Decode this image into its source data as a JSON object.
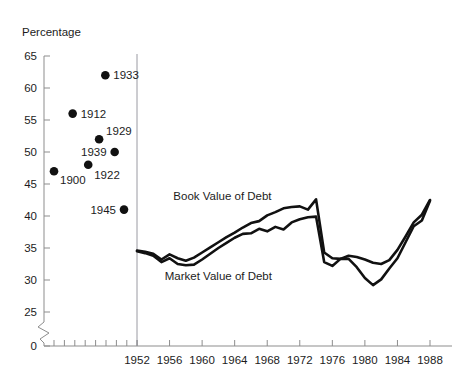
{
  "chart_data": {
    "type": "line",
    "title": "",
    "ylabel": "Percentage",
    "xlabel": "",
    "ylim": [
      25,
      65
    ],
    "y_break_at": 0,
    "y_ticks": [
      0,
      25,
      30,
      35,
      40,
      45,
      50,
      55,
      60,
      65
    ],
    "y_tick_labels": [
      "0",
      "25",
      "30",
      "35",
      "40",
      "45",
      "50",
      "55",
      "60",
      "65"
    ],
    "xlim": [
      1950,
      1989
    ],
    "x_ticks": [
      1952,
      1956,
      1960,
      1964,
      1968,
      1972,
      1976,
      1980,
      1984,
      1988
    ],
    "x_tick_labels": [
      "1952",
      "1956",
      "1960",
      "1964",
      "1968",
      "1972",
      "1976",
      "1980",
      "1984",
      "1988"
    ],
    "grid": false,
    "legend_position": "inline-annotations",
    "scatter_points": [
      {
        "label": "1900",
        "x": 1900,
        "y": 47.0,
        "label_dx": 6,
        "label_dy": 13,
        "label_anchor": "start"
      },
      {
        "label": "1912",
        "x": 1912,
        "y": 56.0,
        "label_dx": 8,
        "label_dy": 4,
        "label_anchor": "start"
      },
      {
        "label": "1922",
        "x": 1922,
        "y": 48.0,
        "label_dx": 6,
        "label_dy": 14,
        "label_anchor": "start"
      },
      {
        "label": "1929",
        "x": 1929,
        "y": 52.0,
        "label_dx": 7,
        "label_dy": -4,
        "label_anchor": "start"
      },
      {
        "label": "1933",
        "x": 1933,
        "y": 62.0,
        "label_dx": 8,
        "label_dy": 4,
        "label_anchor": "start"
      },
      {
        "label": "1939",
        "x": 1939,
        "y": 50.0,
        "label_dx": -8,
        "label_dy": 4,
        "label_anchor": "end"
      },
      {
        "label": "1945",
        "x": 1945,
        "y": 41.0,
        "label_dx": -8,
        "label_dy": 4,
        "label_anchor": "end"
      }
    ],
    "series": [
      {
        "name": "Book Value of Debt",
        "color": "#111111",
        "label_x": 1962.5,
        "label_y": 42.5,
        "values": [
          {
            "x": 1952,
            "y": 34.6
          },
          {
            "x": 1953,
            "y": 34.4
          },
          {
            "x": 1954,
            "y": 34.1
          },
          {
            "x": 1955,
            "y": 33.2
          },
          {
            "x": 1956,
            "y": 34.0
          },
          {
            "x": 1957,
            "y": 33.4
          },
          {
            "x": 1958,
            "y": 33.0
          },
          {
            "x": 1959,
            "y": 33.5
          },
          {
            "x": 1960,
            "y": 34.3
          },
          {
            "x": 1961,
            "y": 35.1
          },
          {
            "x": 1962,
            "y": 35.9
          },
          {
            "x": 1963,
            "y": 36.7
          },
          {
            "x": 1964,
            "y": 37.4
          },
          {
            "x": 1965,
            "y": 38.2
          },
          {
            "x": 1966,
            "y": 38.9
          },
          {
            "x": 1967,
            "y": 39.2
          },
          {
            "x": 1968,
            "y": 40.1
          },
          {
            "x": 1969,
            "y": 40.6
          },
          {
            "x": 1970,
            "y": 41.2
          },
          {
            "x": 1971,
            "y": 41.4
          },
          {
            "x": 1972,
            "y": 41.5
          },
          {
            "x": 1973,
            "y": 41.0
          },
          {
            "x": 1974,
            "y": 42.6
          },
          {
            "x": 1975,
            "y": 34.3
          },
          {
            "x": 1976,
            "y": 33.4
          },
          {
            "x": 1977,
            "y": 33.3
          },
          {
            "x": 1978,
            "y": 33.8
          },
          {
            "x": 1979,
            "y": 33.6
          },
          {
            "x": 1980,
            "y": 33.2
          },
          {
            "x": 1981,
            "y": 32.7
          },
          {
            "x": 1982,
            "y": 32.5
          },
          {
            "x": 1983,
            "y": 33.1
          },
          {
            "x": 1984,
            "y": 34.7
          },
          {
            "x": 1985,
            "y": 36.8
          },
          {
            "x": 1986,
            "y": 39.0
          },
          {
            "x": 1987,
            "y": 40.2
          },
          {
            "x": 1988,
            "y": 42.5
          }
        ]
      },
      {
        "name": "Market Value of Debt",
        "color": "#111111",
        "label_x": 1962.0,
        "label_y": 30.0,
        "values": [
          {
            "x": 1952,
            "y": 34.5
          },
          {
            "x": 1953,
            "y": 34.2
          },
          {
            "x": 1954,
            "y": 33.8
          },
          {
            "x": 1955,
            "y": 32.8
          },
          {
            "x": 1956,
            "y": 33.4
          },
          {
            "x": 1957,
            "y": 32.5
          },
          {
            "x": 1958,
            "y": 32.3
          },
          {
            "x": 1959,
            "y": 32.4
          },
          {
            "x": 1960,
            "y": 33.2
          },
          {
            "x": 1961,
            "y": 34.1
          },
          {
            "x": 1962,
            "y": 35.0
          },
          {
            "x": 1963,
            "y": 35.8
          },
          {
            "x": 1964,
            "y": 36.6
          },
          {
            "x": 1965,
            "y": 37.2
          },
          {
            "x": 1966,
            "y": 37.3
          },
          {
            "x": 1967,
            "y": 38.0
          },
          {
            "x": 1968,
            "y": 37.6
          },
          {
            "x": 1969,
            "y": 38.3
          },
          {
            "x": 1970,
            "y": 37.9
          },
          {
            "x": 1971,
            "y": 39.0
          },
          {
            "x": 1972,
            "y": 39.5
          },
          {
            "x": 1973,
            "y": 39.8
          },
          {
            "x": 1974,
            "y": 39.9
          },
          {
            "x": 1975,
            "y": 32.8
          },
          {
            "x": 1976,
            "y": 32.2
          },
          {
            "x": 1977,
            "y": 33.3
          },
          {
            "x": 1978,
            "y": 33.3
          },
          {
            "x": 1979,
            "y": 32.0
          },
          {
            "x": 1980,
            "y": 30.3
          },
          {
            "x": 1981,
            "y": 29.2
          },
          {
            "x": 1982,
            "y": 30.1
          },
          {
            "x": 1983,
            "y": 31.8
          },
          {
            "x": 1984,
            "y": 33.4
          },
          {
            "x": 1985,
            "y": 35.9
          },
          {
            "x": 1986,
            "y": 38.4
          },
          {
            "x": 1987,
            "y": 39.3
          },
          {
            "x": 1988,
            "y": 42.4
          }
        ]
      }
    ]
  }
}
